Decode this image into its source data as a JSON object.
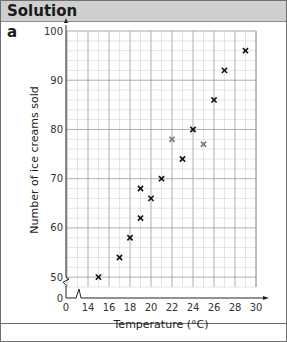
{
  "header": {
    "title": "Solution"
  },
  "part_label": "a",
  "chart_data": {
    "type": "scatter",
    "title": "",
    "xlabel": "Temperature (°C)",
    "ylabel": "Number of ice creams sold",
    "x_ticks": [
      0,
      14,
      16,
      18,
      20,
      22,
      24,
      26,
      28,
      30
    ],
    "y_ticks": [
      0,
      50,
      60,
      70,
      80,
      90,
      100
    ],
    "xlim": [
      12,
      30
    ],
    "ylim": [
      48,
      100
    ],
    "x_axis_break": true,
    "y_axis_break": true,
    "grid": true,
    "marker": "x",
    "series": [
      {
        "name": "Ice cream sales",
        "color": "#111111",
        "points": [
          {
            "x": 15,
            "y": 50
          },
          {
            "x": 17,
            "y": 54
          },
          {
            "x": 18,
            "y": 58
          },
          {
            "x": 19,
            "y": 62
          },
          {
            "x": 19,
            "y": 68
          },
          {
            "x": 20,
            "y": 66
          },
          {
            "x": 21,
            "y": 70
          },
          {
            "x": 23,
            "y": 74
          },
          {
            "x": 24,
            "y": 80
          },
          {
            "x": 26,
            "y": 86
          },
          {
            "x": 27,
            "y": 92
          },
          {
            "x": 29,
            "y": 96
          }
        ]
      },
      {
        "name": "Highlighted points",
        "color": "#7a7a7a",
        "points": [
          {
            "x": 22,
            "y": 78
          },
          {
            "x": 25,
            "y": 77
          }
        ]
      }
    ]
  }
}
